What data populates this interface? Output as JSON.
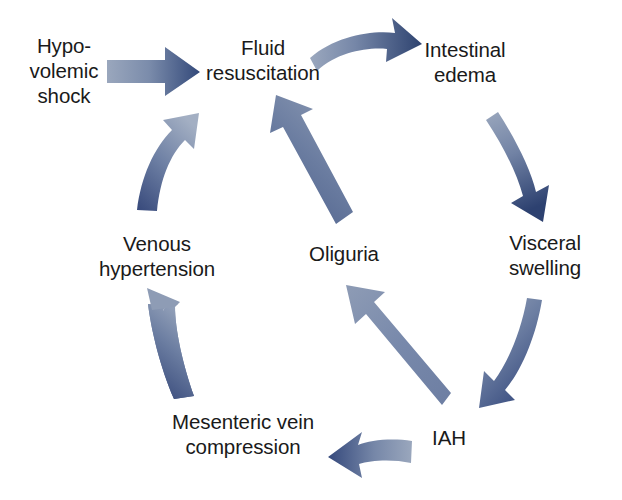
{
  "diagram": {
    "type": "cycle-flowchart",
    "background_color": "#ffffff",
    "text_color": "#1a1a1a",
    "arrow_gradient": {
      "light": "#9aa7bd",
      "mid": "#6f83a6",
      "dark": "#2f4370"
    },
    "nodes": [
      {
        "id": "hypovolemic-shock",
        "label": "Hypo-\nvolemic\nshock",
        "x": 64,
        "y": 70
      },
      {
        "id": "fluid-resuscitation",
        "label": "Fluid\nresuscitation",
        "x": 263,
        "y": 60
      },
      {
        "id": "intestinal-edema",
        "label": "Intestinal\nedema",
        "x": 465,
        "y": 62
      },
      {
        "id": "visceral-swelling",
        "label": "Visceral\nswelling",
        "x": 545,
        "y": 255
      },
      {
        "id": "iah",
        "label": "IAH",
        "x": 449,
        "y": 437
      },
      {
        "id": "mesenteric-vein-compression",
        "label": "Mesenteric vein\ncompression",
        "x": 243,
        "y": 434
      },
      {
        "id": "venous-hypertension",
        "label": "Venous\nhypertension",
        "x": 157,
        "y": 256
      },
      {
        "id": "oliguria",
        "label": "Oliguria",
        "x": 344,
        "y": 253
      }
    ],
    "edges": [
      {
        "id": "shock-to-fluid",
        "from": "hypovolemic-shock",
        "to": "fluid-resuscitation",
        "style": "straight-right"
      },
      {
        "id": "fluid-to-edema",
        "from": "fluid-resuscitation",
        "to": "intestinal-edema",
        "style": "curved-right"
      },
      {
        "id": "edema-to-swelling",
        "from": "intestinal-edema",
        "to": "visceral-swelling",
        "style": "curved-down"
      },
      {
        "id": "swelling-to-iah",
        "from": "visceral-swelling",
        "to": "iah",
        "style": "curved-down-left"
      },
      {
        "id": "iah-to-mesenteric",
        "from": "iah",
        "to": "mesenteric-vein-compression",
        "style": "curved-left"
      },
      {
        "id": "mesenteric-to-venous",
        "from": "mesenteric-vein-compression",
        "to": "venous-hypertension",
        "style": "curved-up"
      },
      {
        "id": "venous-to-fluid",
        "from": "venous-hypertension",
        "to": "fluid-resuscitation",
        "style": "curved-up-right"
      },
      {
        "id": "iah-to-oliguria",
        "from": "iah",
        "to": "oliguria",
        "style": "straight-up-left"
      },
      {
        "id": "oliguria-to-fluid",
        "from": "oliguria",
        "to": "fluid-resuscitation",
        "style": "straight-up-right"
      }
    ]
  }
}
